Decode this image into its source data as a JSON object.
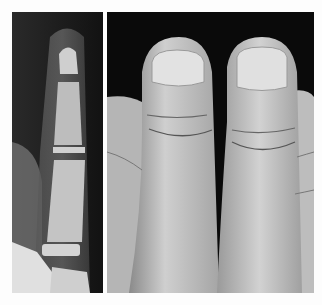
{
  "figure": {
    "panels": [
      {
        "id": "xray",
        "description": "Radiograph of thumb phalanges"
      },
      {
        "id": "photo",
        "description": "Photograph of two thumbs side by side"
      }
    ],
    "colors": {
      "background": "#fdfdfd",
      "xray_bg": "#1c1c1c",
      "photo_bg": "#0a0a0a",
      "skin": "#c8c8c8",
      "bone": "#d8d8d8"
    }
  }
}
